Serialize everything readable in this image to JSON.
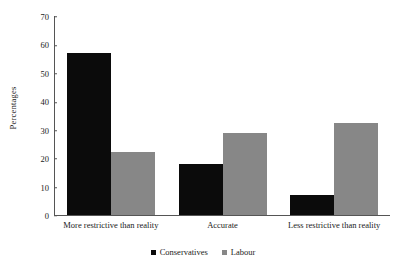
{
  "chart_data": {
    "type": "bar",
    "title": "",
    "xlabel": "",
    "ylabel": "Percentages",
    "ylim": [
      0,
      70
    ],
    "yticks": [
      0,
      10,
      20,
      30,
      40,
      50,
      60,
      70
    ],
    "grid": false,
    "legend_position": "bottom",
    "categories": [
      "More restrictive than reality",
      "Accurate",
      "Less restrictive than reality"
    ],
    "series": [
      {
        "name": "Conservatives",
        "color": "#0b0b0b",
        "values": [
          57,
          18,
          7
        ]
      },
      {
        "name": "Labour",
        "color": "#878787",
        "values": [
          22,
          29,
          32.5
        ]
      }
    ]
  }
}
